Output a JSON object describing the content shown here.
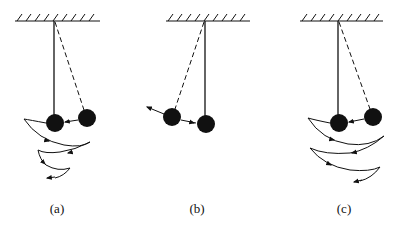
{
  "diagram": {
    "type": "pendulum-collision-sequence",
    "colors": {
      "ink": "#111111",
      "background": "#ffffff"
    },
    "panels": [
      {
        "id": "a",
        "label": "(a)",
        "description": "Ball released from displaced position (dashed) strikes hanging ball; spiral trajectory arcs shown below",
        "ceiling": {
          "x1": 15,
          "x2": 100,
          "y": 21
        },
        "pivot": {
          "x": 53,
          "y": 21
        },
        "hanging_ball": {
          "x": 55,
          "y": 123,
          "r": 9
        },
        "displaced_ball": {
          "x": 87,
          "y": 118,
          "r": 9
        },
        "label_pos": {
          "x": 57,
          "y": 210
        }
      },
      {
        "id": "b",
        "label": "(b)",
        "description": "Hanging ball at rest (solid rod); struck ball rebounds to the left along dashed line",
        "ceiling": {
          "x1": 166,
          "x2": 250,
          "y": 21
        },
        "pivot": {
          "x": 205,
          "y": 21
        },
        "hanging_ball": {
          "x": 206,
          "y": 124,
          "r": 9
        },
        "displaced_ball": {
          "x": 172,
          "y": 117,
          "r": 9
        },
        "label_pos": {
          "x": 197,
          "y": 210
        }
      },
      {
        "id": "c",
        "label": "(c)",
        "description": "Ball released from displaced position strikes hanging ball; wider arcs shown below",
        "ceiling": {
          "x1": 300,
          "x2": 383,
          "y": 21
        },
        "pivot": {
          "x": 338,
          "y": 21
        },
        "hanging_ball": {
          "x": 339,
          "y": 123,
          "r": 9
        },
        "displaced_ball": {
          "x": 373,
          "y": 117,
          "r": 9
        },
        "label_pos": {
          "x": 344,
          "y": 210
        }
      }
    ]
  }
}
